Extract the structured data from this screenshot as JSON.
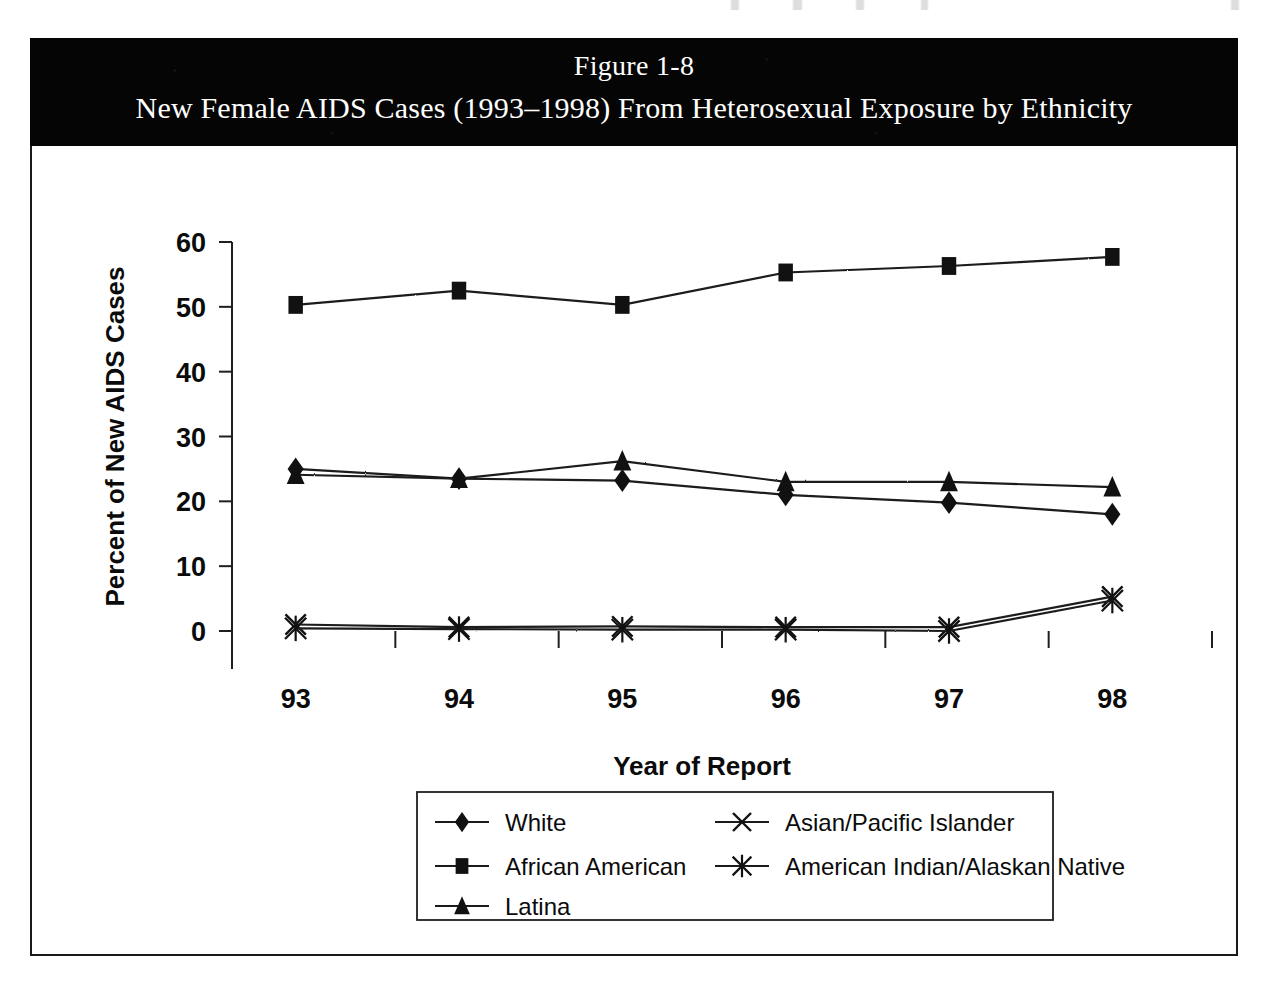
{
  "figure": {
    "label": "Figure 1-8",
    "title": "New Female AIDS Cases (1993–1998) From Heterosexual Exposure by Ethnicity"
  },
  "chart_data": {
    "type": "line",
    "title": "New Female AIDS Cases (1993–1998) From Heterosexual Exposure by Ethnicity",
    "xlabel": "Year of Report",
    "ylabel": "Percent of New AIDS Cases",
    "categories": [
      "93",
      "94",
      "95",
      "96",
      "97",
      "98"
    ],
    "ylim": [
      0,
      60
    ],
    "yticks": [
      0,
      10,
      20,
      30,
      40,
      50,
      60
    ],
    "grid": "horizontal",
    "legend_position": "bottom",
    "series": [
      {
        "name": "White",
        "marker": "diamond",
        "values": [
          25.0,
          23.5,
          23.2,
          21.0,
          19.8,
          18.0
        ]
      },
      {
        "name": "African American",
        "marker": "square",
        "values": [
          50.3,
          52.5,
          50.3,
          55.3,
          56.3,
          57.7
        ]
      },
      {
        "name": "Latina",
        "marker": "triangle",
        "values": [
          24.1,
          23.5,
          26.2,
          23.0,
          23.0,
          22.2
        ]
      },
      {
        "name": "Asian/Pacific Islander",
        "marker": "x",
        "values": [
          1.0,
          0.6,
          0.7,
          0.6,
          0.6,
          5.3
        ]
      },
      {
        "name": "American Indian/Alaskan Native",
        "marker": "star",
        "values": [
          0.4,
          0.3,
          0.2,
          0.2,
          0.0,
          4.7
        ]
      }
    ]
  },
  "legend": {
    "entries": [
      {
        "label": "White",
        "marker": "diamond"
      },
      {
        "label": "Asian/Pacific Islander",
        "marker": "x"
      },
      {
        "label": "African American",
        "marker": "square"
      },
      {
        "label": "American Indian/Alaskan Native",
        "marker": "star"
      },
      {
        "label": "Latina",
        "marker": "triangle"
      }
    ]
  }
}
